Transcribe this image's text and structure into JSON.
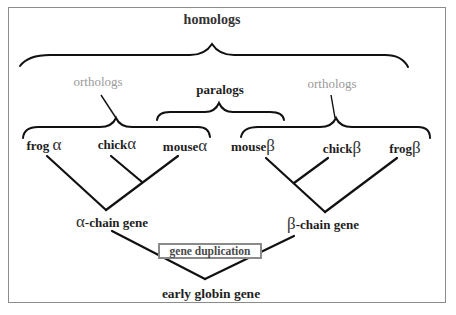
{
  "diagram": {
    "title": "homologs",
    "group_labels": {
      "homologs": "homologs",
      "orthologs_left": "orthologs",
      "paralogs": "paralogs",
      "orthologs_right": "orthologs"
    },
    "leaves": [
      {
        "organism": "frog",
        "chain": "α"
      },
      {
        "organism": "chick",
        "chain": "α"
      },
      {
        "organism": "mouse",
        "chain": "α"
      },
      {
        "organism": "mouse",
        "chain": "β"
      },
      {
        "organism": "chick",
        "chain": "β"
      },
      {
        "organism": "frog",
        "chain": "β"
      }
    ],
    "internal_nodes": {
      "alpha": {
        "symbol": "α",
        "text": "-chain gene"
      },
      "beta": {
        "symbol": "β",
        "text": "-chain gene"
      },
      "root": "early globin gene"
    },
    "event_label": "gene duplication",
    "colors": {
      "text": "#1e1e1e",
      "secondary_text": "#9a9a9a",
      "event_border": "#8a8a8a",
      "frame": "#8c8c8c",
      "lines": "#111111"
    }
  }
}
